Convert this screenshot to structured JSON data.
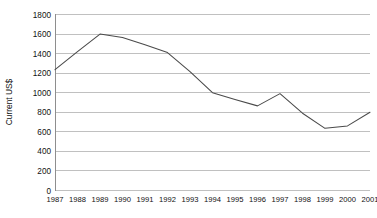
{
  "chart_data": {
    "type": "line",
    "title": "",
    "subtitle": "",
    "xlabel": "",
    "ylabel": "Current US$",
    "categories": [
      "1987",
      "1988",
      "1989",
      "1990",
      "1991",
      "1992",
      "1993",
      "1994",
      "1995",
      "1996",
      "1997",
      "1998",
      "1999",
      "2000",
      "2001"
    ],
    "series": [
      {
        "name": "Current US$",
        "color": "#4a4a4a",
        "values": [
          1235,
          1420,
          1600,
          1565,
          1490,
          1410,
          1215,
          1000,
          930,
          865,
          990,
          790,
          635,
          660,
          800
        ]
      }
    ],
    "ylim": [
      0,
      1800
    ],
    "ytick_step": 200,
    "yticks": [
      0,
      200,
      400,
      600,
      800,
      1000,
      1200,
      1400,
      1600,
      1800
    ],
    "ytick_labels": [
      "0",
      "200",
      "400",
      "600",
      "800",
      "1000",
      "1200",
      "1400",
      "1600",
      "1800"
    ],
    "xtick_labels": [
      "1987",
      "1988",
      "1989",
      "1990",
      "1991",
      "1992",
      "1993",
      "1994",
      "1995",
      "1996",
      "1997",
      "1998",
      "1999",
      "2000",
      "2001"
    ],
    "grid": {
      "horizontal": true,
      "vertical": false,
      "color": "#b9b9b9"
    },
    "legend": {
      "visible": false,
      "position": "none",
      "entries": []
    },
    "annotations": [],
    "axis_colors": {
      "axis": "#8e8e8e",
      "text": "#111111"
    }
  }
}
